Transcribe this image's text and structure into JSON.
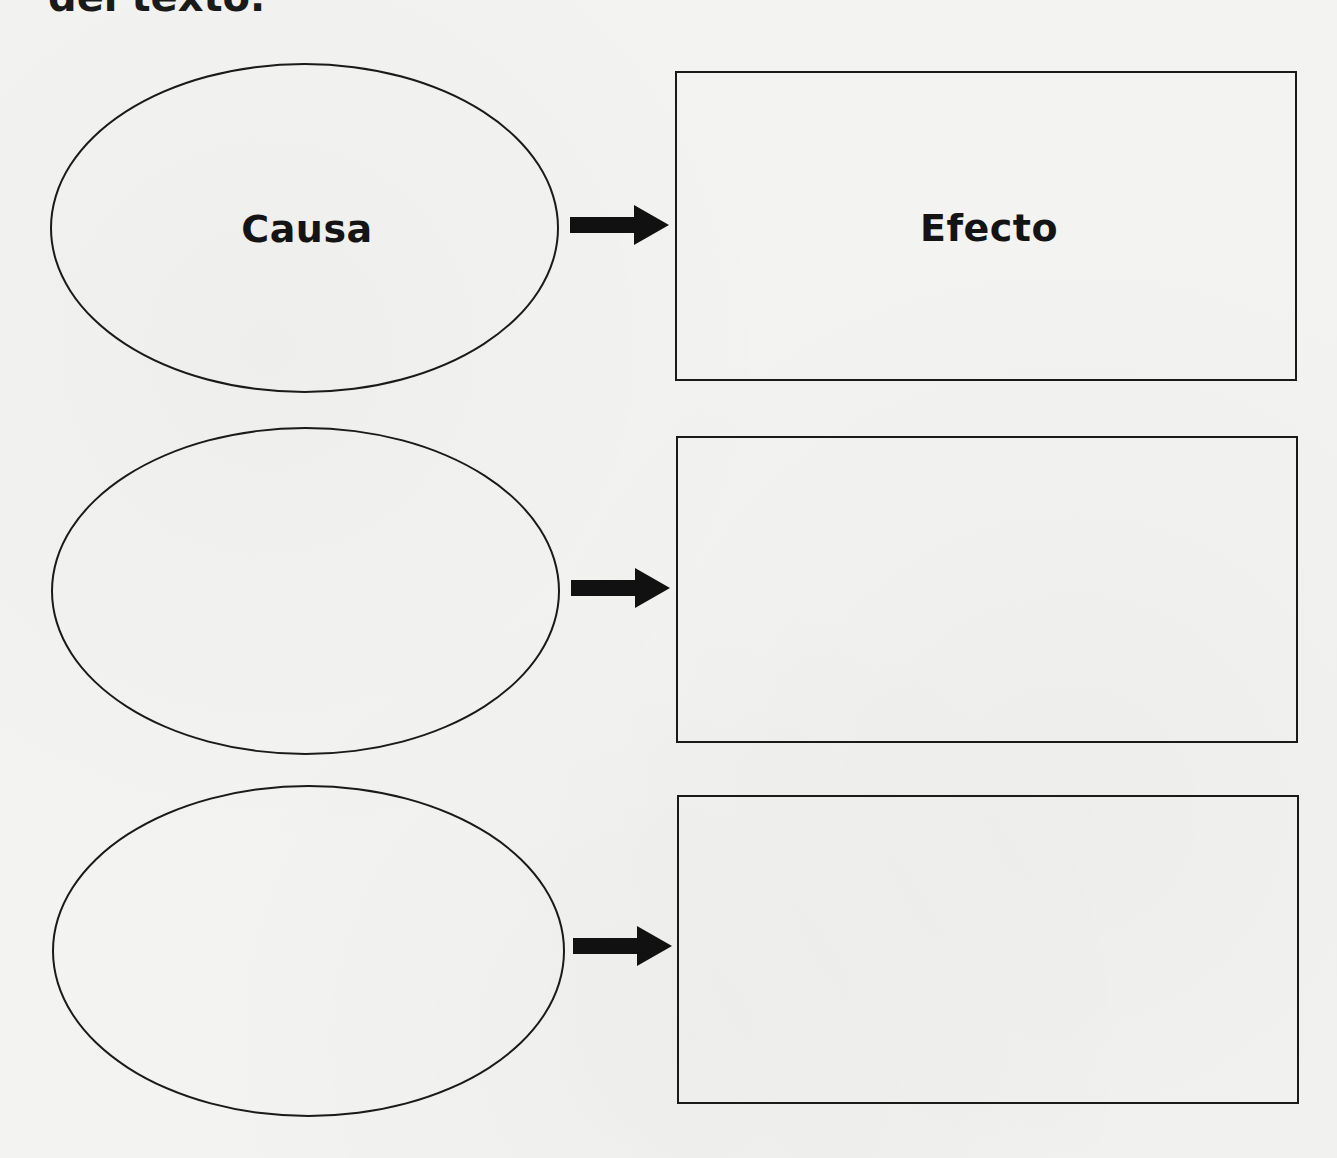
{
  "page": {
    "heading_partial": "del texto."
  },
  "diagram": {
    "type": "cause-effect graphic organizer",
    "rows": [
      {
        "cause_label": "Causa",
        "effect_label": "Efecto"
      },
      {
        "cause_label": "",
        "effect_label": ""
      },
      {
        "cause_label": "",
        "effect_label": ""
      }
    ],
    "arrow_icon": "right-arrow-icon",
    "colors": {
      "stroke": "#1a1a1a",
      "paper": "#f3f3f1"
    }
  }
}
